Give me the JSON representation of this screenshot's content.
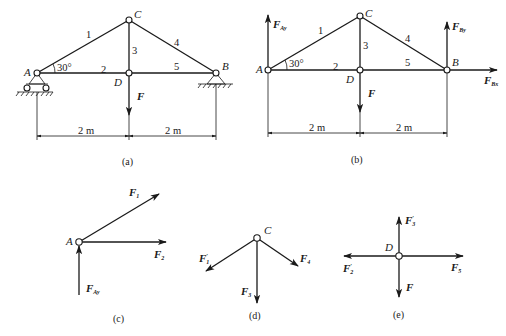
{
  "diagrams": {
    "a": {
      "caption": "(a)",
      "nodes": {
        "A": "A",
        "B": "B",
        "C": "C",
        "D": "D"
      },
      "members": [
        "1",
        "2",
        "3",
        "4",
        "5"
      ],
      "angle": "30°",
      "load": "F",
      "dimensions": [
        "2 m",
        "2 m"
      ],
      "supports": {
        "A": "roller support",
        "B": "pin support"
      }
    },
    "b": {
      "caption": "(b)",
      "nodes": {
        "A": "A",
        "B": "B",
        "C": "C",
        "D": "D"
      },
      "members": [
        "1",
        "2",
        "3",
        "4",
        "5"
      ],
      "angle": "30°",
      "load": "F",
      "reactions": {
        "FAy": {
          "main": "F",
          "sub": "Ay"
        },
        "FBy": {
          "main": "F",
          "sub": "By"
        },
        "FBx": {
          "main": "F",
          "sub": "Bx"
        }
      },
      "dimensions": [
        "2 m",
        "2 m"
      ]
    },
    "c": {
      "caption": "(c)",
      "node": "A",
      "forces": {
        "F1": {
          "main": "F",
          "sub": "1"
        },
        "F2": {
          "main": "F",
          "sub": "2"
        },
        "FAy": {
          "main": "F",
          "sub": "Ay"
        }
      }
    },
    "d": {
      "caption": "(d)",
      "node": "C",
      "forces": {
        "F1p": {
          "main": "F",
          "sub": "1",
          "prime": "′"
        },
        "F3": {
          "main": "F",
          "sub": "3"
        },
        "F4": {
          "main": "F",
          "sub": "4"
        }
      }
    },
    "e": {
      "caption": "(e)",
      "node": "D",
      "forces": {
        "F3p": {
          "main": "F",
          "sub": "3",
          "prime": "′"
        },
        "F2p": {
          "main": "F",
          "sub": "2",
          "prime": "′"
        },
        "F5": {
          "main": "F",
          "sub": "5"
        },
        "F": {
          "main": "F"
        }
      }
    }
  },
  "colors": {
    "ink": "#1a1a1a",
    "background": "#ffffff"
  }
}
